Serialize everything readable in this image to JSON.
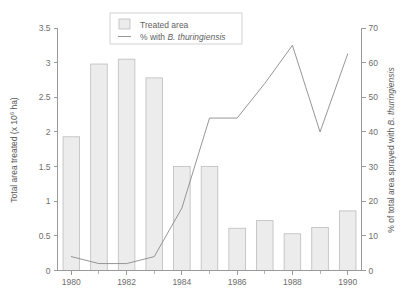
{
  "chart_data": {
    "type": "bar",
    "title": "",
    "subtitle": "",
    "xlabel": "",
    "ylabel": "Total area treated (x 10⁶ ha)",
    "ylabel_right": "% of total area sprayed with B. thuringiensis",
    "ylabel_right_plain": "% of total area sprayed with ",
    "ylabel_right_italic": "B. thuringiensis",
    "ylabel_prefix": "Total area treated (x 10",
    "ylabel_sup": "6",
    "ylabel_suffix": " ha)",
    "grid": false,
    "legend_position": "top-center",
    "x": [
      1980,
      1981,
      1982,
      1983,
      1984,
      1985,
      1986,
      1987,
      1988,
      1989,
      1990
    ],
    "categories": [
      "1980",
      "1981",
      "1982",
      "1983",
      "1984",
      "1985",
      "1986",
      "1987",
      "1988",
      "1989",
      "1990"
    ],
    "xlim": [
      1979.5,
      1990.5
    ],
    "ylim": [
      0,
      3.5
    ],
    "ylim_right": [
      0,
      70
    ],
    "xticks_major": [
      "1980",
      "1982",
      "1984",
      "1986",
      "1988",
      "1990"
    ],
    "xtick_major_values": [
      1980,
      1982,
      1984,
      1986,
      1988,
      1990
    ],
    "xtick_minor_values": [
      1981,
      1983,
      1985,
      1987,
      1989
    ],
    "yticks_left": [
      "0",
      "0.5",
      "1",
      "1.5",
      "2",
      "2.5",
      "3",
      "3.5"
    ],
    "ytick_left_values": [
      0,
      0.5,
      1,
      1.5,
      2,
      2.5,
      3,
      3.5
    ],
    "yticks_right": [
      "0",
      "10",
      "20",
      "30",
      "40",
      "50",
      "60",
      "70"
    ],
    "ytick_right_values": [
      0,
      10,
      20,
      30,
      40,
      50,
      60,
      70
    ],
    "series": [
      {
        "name": "Treated area",
        "type": "bar",
        "axis": "left",
        "units": "x 10^6 ha",
        "values": [
          1.93,
          2.98,
          3.05,
          2.78,
          1.5,
          1.5,
          0.61,
          0.72,
          0.53,
          0.62,
          0.86
        ]
      },
      {
        "name": "% with B. thuringiensis",
        "name_plain": "% with ",
        "name_italic": "B. thuringiensis",
        "type": "line",
        "axis": "right",
        "units": "%",
        "values": [
          4,
          2,
          2,
          4,
          18,
          44,
          44,
          54,
          65,
          40,
          62.5
        ]
      }
    ],
    "colors": {
      "bar_fill": "#ececec",
      "bar_stroke": "#bcbcbc",
      "line": "#8a8a8a",
      "axis": "#9a9a9a",
      "text": "#5f5f5f",
      "background": "#ffffff"
    }
  },
  "legend": {
    "items": [
      {
        "label": "Treated area",
        "marker": "bar-swatch"
      },
      {
        "label_plain": "% with ",
        "label_italic": "B. thuringiensis",
        "marker": "line-swatch"
      }
    ]
  }
}
